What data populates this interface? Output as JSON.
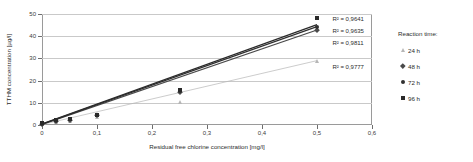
{
  "chart_data": {
    "type": "scatter",
    "title": "",
    "xlabel": "Residual free chlorine concentration [mg/l]",
    "ylabel": "TTHM concentration [µg/l]",
    "xlim": [
      0,
      0.6
    ],
    "ylim": [
      0,
      50
    ],
    "xticks": [
      "0",
      "0,1",
      "0,2",
      "0,3",
      "0,4",
      "0,5",
      "0,6"
    ],
    "xtick_values": [
      0,
      0.1,
      0.2,
      0.3,
      0.4,
      0.5,
      0.6
    ],
    "yticks": [
      "0",
      "10",
      "20",
      "30",
      "40",
      "50"
    ],
    "ytick_values": [
      0,
      10,
      20,
      30,
      40,
      50
    ],
    "grid": "horizontal",
    "legend_position": "right",
    "legend_title": "Reaction time:",
    "series": [
      {
        "name": "24 h",
        "marker": "triangle",
        "color": "#b6b6b6",
        "r2_label": "R² = 0,9777",
        "trend": {
          "x0": 0,
          "y0": 0.2,
          "x1": 0.5,
          "y1": 29.0
        },
        "points": [
          {
            "x": 0.0,
            "y": 0.3
          },
          {
            "x": 0.025,
            "y": 1.2
          },
          {
            "x": 0.05,
            "y": 1.9
          },
          {
            "x": 0.1,
            "y": 3.6
          },
          {
            "x": 0.25,
            "y": 10.2
          },
          {
            "x": 0.5,
            "y": 29.0
          }
        ]
      },
      {
        "name": "48 h",
        "marker": "diamond",
        "color": "#4a4a4a",
        "r2_label": "R² = 0,9811",
        "trend": {
          "x0": 0,
          "y0": 0.3,
          "x1": 0.5,
          "y1": 42.8
        },
        "points": [
          {
            "x": 0.0,
            "y": 0.5
          },
          {
            "x": 0.025,
            "y": 1.8
          },
          {
            "x": 0.05,
            "y": 2.4
          },
          {
            "x": 0.1,
            "y": 4.3
          },
          {
            "x": 0.25,
            "y": 14.8
          },
          {
            "x": 0.5,
            "y": 42.8
          }
        ]
      },
      {
        "name": "72 h",
        "marker": "circle",
        "color": "#303030",
        "r2_label": "R² = 0,9635",
        "trend": {
          "x0": 0,
          "y0": 0.4,
          "x1": 0.5,
          "y1": 44.3
        },
        "points": [
          {
            "x": 0.0,
            "y": 0.6
          },
          {
            "x": 0.025,
            "y": 2.0
          },
          {
            "x": 0.05,
            "y": 2.6
          },
          {
            "x": 0.1,
            "y": 4.5
          },
          {
            "x": 0.25,
            "y": 15.4
          },
          {
            "x": 0.5,
            "y": 44.3
          }
        ]
      },
      {
        "name": "96 h",
        "marker": "square",
        "color": "#2a2a2a",
        "r2_label": "R² = 0,9641",
        "trend": {
          "x0": 0,
          "y0": 0.5,
          "x1": 0.5,
          "y1": 45.2
        },
        "points": [
          {
            "x": 0.0,
            "y": 0.8
          },
          {
            "x": 0.025,
            "y": 2.2
          },
          {
            "x": 0.05,
            "y": 2.8
          },
          {
            "x": 0.1,
            "y": 4.7
          },
          {
            "x": 0.25,
            "y": 15.9
          },
          {
            "x": 0.5,
            "y": 48.2
          }
        ]
      }
    ],
    "annotations": [
      {
        "text": "R² = 0,9641",
        "x": 0.528,
        "y": 47.5
      },
      {
        "text": "R² = 0,9635",
        "x": 0.528,
        "y": 42.2
      },
      {
        "text": "R² = 0,9811",
        "x": 0.528,
        "y": 36.8
      },
      {
        "text": "R² = 0,9777",
        "x": 0.528,
        "y": 25.8
      }
    ]
  },
  "legend": {
    "title": "Reaction time:",
    "items": [
      {
        "label": "24 h",
        "marker": "triangle",
        "color": "#b6b6b6"
      },
      {
        "label": "48 h",
        "marker": "diamond",
        "color": "#4a4a4a"
      },
      {
        "label": "72 h",
        "marker": "circle",
        "color": "#303030"
      },
      {
        "label": "96 h",
        "marker": "square",
        "color": "#2a2a2a"
      }
    ]
  }
}
